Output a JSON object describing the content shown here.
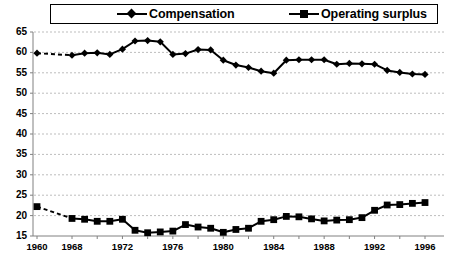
{
  "legend": {
    "position": "top",
    "entries": [
      {
        "label": "Compensation",
        "marker": "diamond-marker-icon",
        "color": "#000000"
      },
      {
        "label": "Operating surplus",
        "marker": "square-marker-icon",
        "color": "#000000"
      }
    ]
  },
  "axes": {
    "y_ticks": [
      "65",
      "60",
      "55",
      "50",
      "45",
      "40",
      "35",
      "30",
      "25",
      "20",
      "15"
    ],
    "x_ticks": [
      "1960",
      "1968",
      "1972",
      "1976",
      "1980",
      "1984",
      "1988",
      "1992",
      "1996"
    ]
  },
  "chart_data": {
    "type": "line",
    "title": "",
    "xlabel": "",
    "ylabel": "",
    "ylim": [
      15,
      65
    ],
    "ytick_step": 5,
    "grid": true,
    "legend_position": "top",
    "x": [
      1960,
      1968,
      1969,
      1970,
      1971,
      1972,
      1973,
      1974,
      1975,
      1976,
      1977,
      1978,
      1979,
      1980,
      1981,
      1982,
      1983,
      1984,
      1985,
      1986,
      1987,
      1988,
      1989,
      1990,
      1991,
      1992,
      1993,
      1994,
      1995,
      1996
    ],
    "gap_after_index": 0,
    "series": [
      {
        "name": "Compensation",
        "marker": "diamond",
        "color": "#000000",
        "values": [
          59.8,
          59.3,
          59.8,
          59.9,
          59.5,
          60.8,
          62.8,
          62.9,
          62.6,
          59.5,
          59.7,
          60.7,
          60.6,
          58.1,
          56.9,
          56.3,
          55.4,
          54.9,
          58.1,
          58.2,
          58.2,
          58.2,
          57.1,
          57.3,
          57.2,
          57.1,
          55.6,
          55.1,
          54.7,
          54.6
        ]
      },
      {
        "name": "Operating surplus",
        "marker": "square",
        "color": "#000000",
        "values": [
          22.2,
          19.3,
          19.1,
          18.6,
          18.6,
          19.1,
          16.4,
          15.8,
          16.0,
          16.2,
          17.8,
          17.2,
          16.9,
          15.9,
          16.6,
          16.9,
          18.6,
          19.0,
          19.8,
          19.7,
          19.2,
          18.7,
          18.9,
          19.0,
          19.5,
          21.3,
          22.6,
          22.7,
          23.0,
          23.2
        ]
      }
    ]
  },
  "colors": {
    "axis": "#808080",
    "grid": "#bdbdbd",
    "series": "#000000",
    "background": "#ffffff"
  }
}
